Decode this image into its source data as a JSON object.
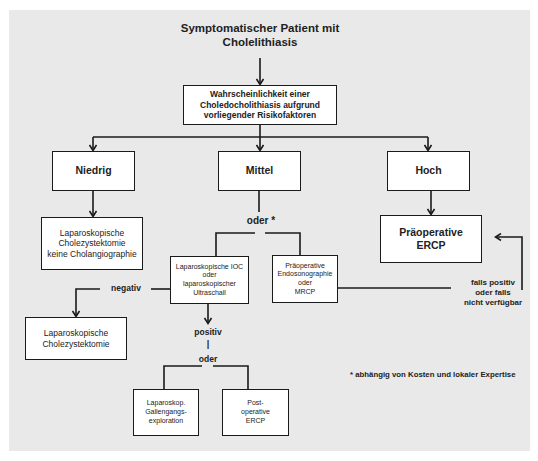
{
  "diagram": {
    "title": "Symptomatischer Patient mit\nCholelithiasis",
    "nodes": {
      "probability": "Wahrscheinlichkeit einer\nCholedocholithiasis aufgrund\nvorliegender Risikofaktoren",
      "low": "Niedrig",
      "medium": "Mittel",
      "high": "Hoch",
      "lap_chole_no_cholangio": "Laparoskopische\nCholezystektomie\nkeine Cholangiographie",
      "preop_ercp": "Präoperative\nERCP",
      "lap_ioc": "Laparoskopische IOC\noder\nlaparoskopischer\nUltraschall",
      "preop_eus_mrcp": "Präoperative\nEndosonographie\noder\nMRCP",
      "lap_chole": "Laparoskopische\nCholezystektomie",
      "lap_cbd_exploration": "Laparoskop.\nGallengangs-\nexploration",
      "postop_ercp": "Post-\noperative\nERCP"
    },
    "edge_labels": {
      "oder_star": "oder *",
      "negativ": "negativ",
      "positiv": "positiv",
      "bar": "|",
      "oder": "oder",
      "falls_positiv": "falls positiv\noder falls\nnicht verfügbar"
    },
    "footnote": "* abhängig von Kosten und lokaler Expertise"
  }
}
